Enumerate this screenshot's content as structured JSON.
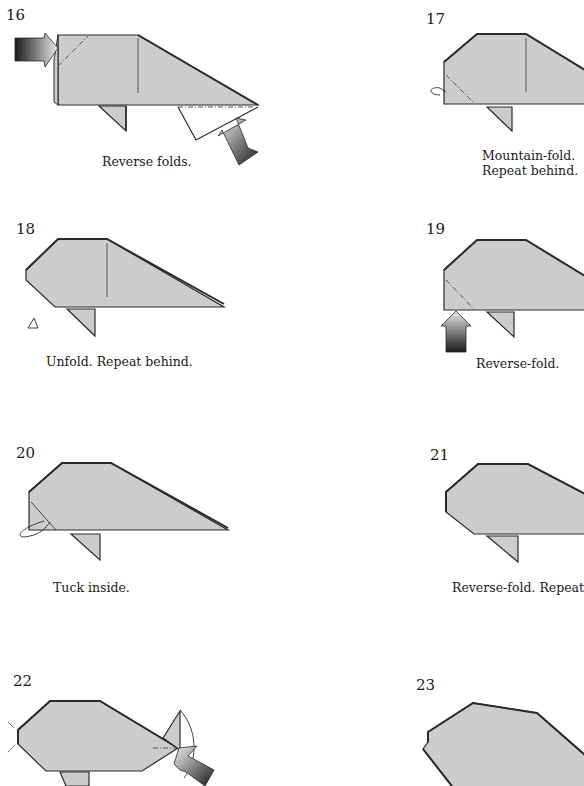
{
  "page": {
    "paper_color": "#cccccc",
    "line_color": "#2a2a2a"
  },
  "steps": [
    {
      "number": "16",
      "caption": "Reverse folds.",
      "caption_line2": ""
    },
    {
      "number": "17",
      "caption": "Mountain-fold.",
      "caption_line2": "Repeat behind."
    },
    {
      "number": "18",
      "caption": "Unfold. Repeat behind.",
      "caption_line2": ""
    },
    {
      "number": "19",
      "caption": "Reverse-fold.",
      "caption_line2": ""
    },
    {
      "number": "20",
      "caption": "Tuck inside.",
      "caption_line2": ""
    },
    {
      "number": "21",
      "caption": "Reverse-fold. Repeat",
      "caption_line2": ""
    },
    {
      "number": "22",
      "caption": "",
      "caption_line2": ""
    },
    {
      "number": "23",
      "caption": "",
      "caption_line2": ""
    }
  ],
  "icons": {
    "push_arrow": "push-arrow",
    "fold_arrow": "fold-arrow",
    "valley_line": "dash-dot crease"
  }
}
